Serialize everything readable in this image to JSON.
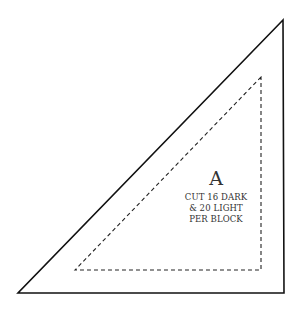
{
  "pattern_piece": {
    "letter": "A",
    "instructions": [
      "CUT 16 DARK",
      "& 20 LIGHT",
      "PER BLOCK"
    ],
    "outline_color": "#111111",
    "seam_line_color": "#222222"
  }
}
